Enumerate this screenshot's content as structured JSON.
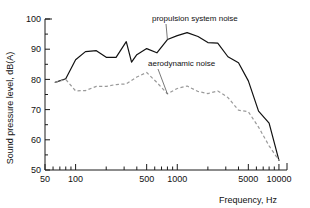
{
  "chart_data": {
    "type": "line",
    "title": "",
    "xlabel": "Frequency, Hz",
    "ylabel": "Sound pressure level, dB(A)",
    "xscale": "log",
    "yscale": "linear",
    "xlim": [
      50,
      12000
    ],
    "ylim": [
      50,
      100
    ],
    "grid": false,
    "legend_position": "inline-annotations",
    "x_tick_labels": [
      "50",
      "100",
      "500",
      "1000",
      "5000",
      "10000"
    ],
    "x_tick_values": [
      50,
      100,
      500,
      1000,
      5000,
      10000
    ],
    "x_minor_ticks": [
      60,
      70,
      80,
      90,
      200,
      300,
      400,
      600,
      700,
      800,
      900,
      2000,
      3000,
      4000,
      6000,
      7000,
      8000,
      9000
    ],
    "y_tick_labels": [
      "50",
      "60",
      "70",
      "80",
      "90",
      "100"
    ],
    "y_tick_values": [
      50,
      60,
      70,
      80,
      90,
      100
    ],
    "y_minor_ticks": [
      55,
      65,
      75,
      85,
      95
    ],
    "series": [
      {
        "name": "propulsion system noise",
        "style": "solid",
        "color": "#111111",
        "x": [
          63,
          80,
          100,
          125,
          160,
          200,
          250,
          315,
          355,
          400,
          500,
          630,
          800,
          1000,
          1250,
          1600,
          2000,
          2500,
          3150,
          4000,
          5000,
          6300,
          8000,
          10000
        ],
        "y": [
          79.0,
          80.2,
          86.5,
          89.2,
          89.5,
          87.3,
          87.3,
          92.5,
          85.7,
          88.2,
          90.2,
          88.8,
          93.2,
          94.5,
          95.5,
          94.2,
          92.2,
          92.0,
          87.5,
          85.5,
          79.5,
          69.5,
          65.5,
          53.2
        ]
      },
      {
        "name": "aerodynamic noise",
        "style": "dashed",
        "color": "#9a9a9a",
        "x": [
          63,
          80,
          100,
          125,
          160,
          200,
          250,
          315,
          400,
          500,
          630,
          800,
          1000,
          1250,
          1600,
          2000,
          2500,
          3150,
          4000,
          5000,
          6300,
          8000,
          10000
        ],
        "y": [
          79.0,
          80.0,
          76.2,
          76.3,
          77.7,
          77.7,
          78.3,
          78.5,
          80.8,
          82.3,
          79.0,
          75.2,
          77.0,
          77.8,
          76.0,
          75.3,
          76.2,
          74.0,
          69.8,
          69.3,
          64.2,
          58.0,
          53.2
        ]
      }
    ],
    "annotations": [
      {
        "text": "propulsion system noise",
        "x_px": 152,
        "y_px": 21
      },
      {
        "text": "aerodynamic noise",
        "x_px": 148,
        "y_px": 66
      }
    ]
  }
}
